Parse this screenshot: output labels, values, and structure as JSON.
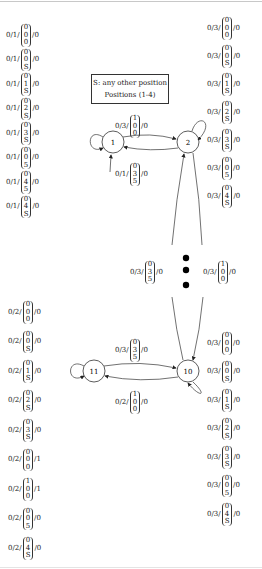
{
  "legend": {
    "line1": "S: any other position",
    "line2": "Positions (1-4)"
  },
  "states": [
    {
      "id": "1",
      "label": "1",
      "cx": 113,
      "cy": 142
    },
    {
      "id": "2",
      "label": "2",
      "cx": 188,
      "cy": 142
    },
    {
      "id": "10",
      "label": "10",
      "cx": 188,
      "cy": 371
    },
    {
      "id": "11",
      "label": "11",
      "cx": 94,
      "cy": 371
    }
  ],
  "left_top_labels": [
    {
      "prefix": "0/1/",
      "vec": [
        "0",
        "0",
        "0"
      ],
      "suffix": "/0"
    },
    {
      "prefix": "0/1/",
      "vec": [
        "0",
        "0",
        "S"
      ],
      "suffix": "/0"
    },
    {
      "prefix": "0/1/",
      "vec": [
        "0",
        "1",
        "S"
      ],
      "suffix": "/0"
    },
    {
      "prefix": "0/1/",
      "vec": [
        "0",
        "2",
        "S"
      ],
      "suffix": "/0"
    },
    {
      "prefix": "0/1/",
      "vec": [
        "0",
        "3",
        "S"
      ],
      "suffix": "/0"
    },
    {
      "prefix": "0/1/",
      "vec": [
        "0",
        "0",
        "5"
      ],
      "suffix": "/0"
    },
    {
      "prefix": "0/1/",
      "vec": [
        "0",
        "4",
        "5"
      ],
      "suffix": "/0"
    },
    {
      "prefix": "0/1/",
      "vec": [
        "0",
        "4",
        "S"
      ],
      "suffix": "/0"
    }
  ],
  "left_bottom_labels": [
    {
      "prefix": "0/2/",
      "vec": [
        "0",
        "0",
        "0"
      ],
      "suffix": "/0"
    },
    {
      "prefix": "0/2/",
      "vec": [
        "0",
        "0",
        "S"
      ],
      "suffix": "/0"
    },
    {
      "prefix": "0/2/",
      "vec": [
        "0",
        "1",
        "S"
      ],
      "suffix": "/0"
    },
    {
      "prefix": "0/2/",
      "vec": [
        "0",
        "2",
        "S"
      ],
      "suffix": "/0"
    },
    {
      "prefix": "0/2/",
      "vec": [
        "0",
        "3",
        "S"
      ],
      "suffix": "/0"
    },
    {
      "prefix": "0/2/",
      "vec": [
        "0",
        "0",
        "0"
      ],
      "suffix": "/1"
    },
    {
      "prefix": "0/2/",
      "vec": [
        "1",
        "0",
        "0"
      ],
      "suffix": "/1"
    },
    {
      "prefix": "0/2/",
      "vec": [
        "0",
        "0",
        "5"
      ],
      "suffix": "/0"
    },
    {
      "prefix": "0/2/",
      "vec": [
        "0",
        "4",
        "S"
      ],
      "suffix": "/0"
    }
  ],
  "right_top_labels": [
    {
      "prefix": "0/3/",
      "vec": [
        "0",
        "0",
        "0"
      ],
      "suffix": "/0"
    },
    {
      "prefix": "0/3/",
      "vec": [
        "0",
        "0",
        "S"
      ],
      "suffix": "/0"
    },
    {
      "prefix": "0/3/",
      "vec": [
        "0",
        "1",
        "S"
      ],
      "suffix": "/0"
    },
    {
      "prefix": "0/3/",
      "vec": [
        "0",
        "2",
        "S"
      ],
      "suffix": "/0"
    },
    {
      "prefix": "0/3/",
      "vec": [
        "0",
        "3",
        "S"
      ],
      "suffix": "/0"
    },
    {
      "prefix": "0/3/",
      "vec": [
        "0",
        "0",
        "5"
      ],
      "suffix": "/0"
    },
    {
      "prefix": "0/3/",
      "vec": [
        "0",
        "4",
        "S"
      ],
      "suffix": "/0"
    }
  ],
  "right_bottom_labels": [
    {
      "prefix": "0/3/",
      "vec": [
        "0",
        "0",
        "0"
      ],
      "suffix": "/0"
    },
    {
      "prefix": "0/3/",
      "vec": [
        "0",
        "0",
        "S"
      ],
      "suffix": "/0"
    },
    {
      "prefix": "0/3/",
      "vec": [
        "0",
        "1",
        "S"
      ],
      "suffix": "/0"
    },
    {
      "prefix": "0/3/",
      "vec": [
        "0",
        "2",
        "S"
      ],
      "suffix": "/0"
    },
    {
      "prefix": "0/3/",
      "vec": [
        "0",
        "3",
        "S"
      ],
      "suffix": "/0"
    },
    {
      "prefix": "0/3/",
      "vec": [
        "0",
        "0",
        "5"
      ],
      "suffix": "/0"
    },
    {
      "prefix": "0/3/",
      "vec": [
        "0",
        "4",
        "S"
      ],
      "suffix": "/0"
    }
  ],
  "edge_labels": {
    "e1_2": {
      "prefix": "0/3/",
      "vec": [
        "1",
        "0",
        "0"
      ],
      "suffix": "/0"
    },
    "e2_1": {
      "prefix": "0/1/",
      "vec": [
        "0",
        "3",
        "5"
      ],
      "suffix": "/0"
    },
    "mid_left": {
      "prefix": "0/3/",
      "vec": [
        "0",
        "3",
        "5"
      ],
      "suffix": "/0"
    },
    "mid_right": {
      "prefix": "0/3/",
      "vec": [
        "1",
        "0",
        "0"
      ],
      "suffix": "/0"
    },
    "e11_10": {
      "prefix": "0/3/",
      "vec": [
        "0",
        "3",
        "5"
      ],
      "suffix": "/0"
    },
    "e10_11": {
      "prefix": "0/2/",
      "vec": [
        "1",
        "0",
        "0"
      ],
      "suffix": "/0"
    }
  }
}
